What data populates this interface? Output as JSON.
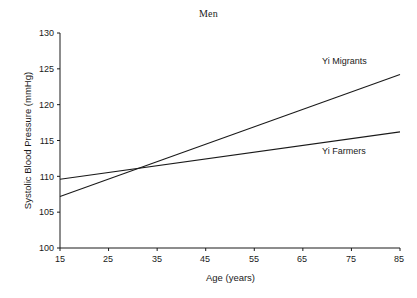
{
  "chart_data": {
    "type": "line",
    "title": "Men",
    "xlabel": "Age (years)",
    "ylabel": "Systolic Blood Pressure (mmHg)",
    "xlim": [
      15,
      85
    ],
    "ylim": [
      100,
      130
    ],
    "xticks": [
      15,
      25,
      35,
      45,
      55,
      65,
      75,
      85
    ],
    "xtick_labels": [
      "15",
      "25",
      "35",
      "45",
      "55",
      "65",
      "75",
      "85"
    ],
    "yticks": [
      100,
      105,
      110,
      115,
      120,
      125,
      130
    ],
    "ytick_labels": [
      "100",
      "105",
      "110",
      "115",
      "120",
      "125",
      "130"
    ],
    "grid": false,
    "legend_position": "inline-annotations",
    "x": [
      15,
      85
    ],
    "series": [
      {
        "name": "Yi Migrants",
        "values": [
          107.2,
          124.2
        ],
        "color": "#1a1a1a",
        "label_x": 60,
        "label_y": 126.8
      },
      {
        "name": "Yi Farmers",
        "values": [
          109.6,
          116.2
        ],
        "color": "#1a1a1a",
        "label_x": 62,
        "label_y": 113.2
      }
    ],
    "annotations": [
      {
        "text": "Yi Migrants",
        "note": "label above the steeper upper line near the right side"
      },
      {
        "text": "Yi Farmers",
        "note": "label below the flatter line near the right side"
      }
    ],
    "intersection": {
      "age": 31,
      "value": 111.0
    }
  },
  "axes": {
    "axis_color": "#1a1a1a",
    "tick_color": "#1a1a1a"
  }
}
